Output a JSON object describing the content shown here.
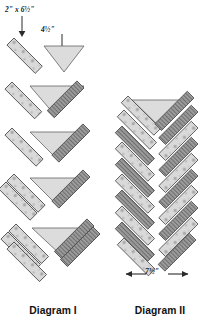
{
  "page": {
    "kind": "quilting-construction-diagram",
    "background": "#ffffff"
  },
  "labels": {
    "strip_size": "2\" x 6½\"",
    "triangle_size": "4½\"",
    "block_width": "7½\""
  },
  "captions": {
    "diagram_one": "Diagram I",
    "diagram_two": "Diagram II"
  },
  "palette": {
    "speckled_fill": "#d9d9d9",
    "speckled_dot": "#a6a6a6",
    "striped_fill": "#9e9e9e",
    "striped_line": "#6f6f6f",
    "triangle_fill": "#dcdcdc",
    "outline": "#4a4a4a",
    "arrow": "#2a2a2a",
    "text": "#151515"
  },
  "diagram_one": {
    "title": "Diagram I",
    "step_count": 5,
    "description": "Progressive chevron unit assembly: strips added around a center triangle",
    "steps": [
      {
        "index": 1,
        "label_visible": true,
        "speckled_strips": 1,
        "striped_strips": 0,
        "triangle": true
      },
      {
        "index": 2,
        "label_visible": false,
        "speckled_strips": 1,
        "striped_strips": 1,
        "triangle": true
      },
      {
        "index": 3,
        "label_visible": false,
        "speckled_strips": 1,
        "striped_strips": 1,
        "triangle": true
      },
      {
        "index": 4,
        "label_visible": false,
        "speckled_strips": 2,
        "striped_strips": 1,
        "triangle": true
      },
      {
        "index": 5,
        "label_visible": false,
        "speckled_strips": 2,
        "striped_strips": 2,
        "triangle": true
      }
    ]
  },
  "diagram_two": {
    "title": "Diagram II",
    "description": "Braided herringbone column of stacked chevron rows",
    "row_count": 9,
    "width_label": "7½\""
  },
  "icons": {
    "pointer_down": "arrow-down-icon",
    "pointer_left": "arrow-left-icon",
    "pointer_right": "arrow-right-icon"
  }
}
